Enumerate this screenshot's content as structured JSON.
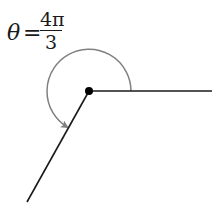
{
  "diagram": {
    "type": "angle",
    "label": {
      "variable": "θ",
      "equals": "=",
      "numerator": "4π",
      "denominator": "3"
    },
    "vertex": [
      89,
      91
    ],
    "initial_side_end": [
      212,
      91
    ],
    "terminal_side_end": [
      27,
      202
    ],
    "arc_radius": 42,
    "colors": {
      "rays": "#1a1a1a",
      "arc": "#808080",
      "vertex": "#000000"
    }
  }
}
